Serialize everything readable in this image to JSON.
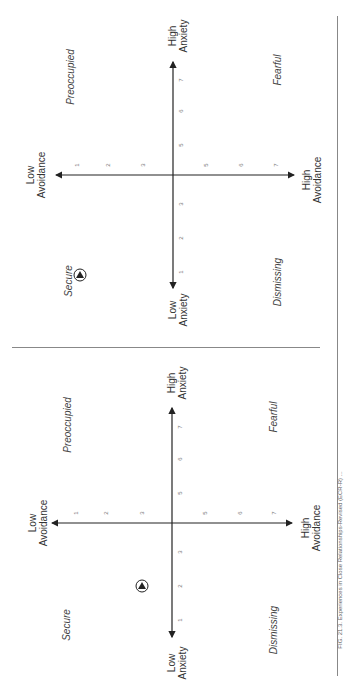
{
  "figure": {
    "caption": "FIG. 21.3. Experiences in Close Relationships-Revised (ECR-R) ..."
  },
  "panels": [
    {
      "id": "top",
      "axes": {
        "avoidance_low": "Low\nAvoidance",
        "avoidance_high": "High\nAvoidance",
        "anxiety_low": "Low\nAnxiety",
        "anxiety_high": "High\nAnxiety"
      },
      "quadrants": {
        "preoccupied": "Preoccupied",
        "fearful": "Fearful",
        "dismissing": "Dismissing",
        "secure": "Secure"
      },
      "avoidance_ticks": [
        "1",
        "2",
        "3",
        "5",
        "6",
        "7"
      ],
      "anxiety_ticks": [
        "1",
        "2",
        "3",
        "5",
        "6",
        "7"
      ],
      "marker": {
        "label": "Secure",
        "avoidance": 1.3,
        "anxiety": 1.0
      }
    },
    {
      "id": "bottom",
      "axes": {
        "avoidance_low": "Low\nAvoidance",
        "avoidance_high": "High\nAvoidance",
        "anxiety_low": "Low\nAnxiety",
        "anxiety_high": "High\nAnxiety"
      },
      "quadrants": {
        "preoccupied": "Preoccupied",
        "fearful": "Fearful",
        "dismissing": "Dismissing",
        "secure": "Secure"
      },
      "avoidance_ticks": [
        "1",
        "2",
        "3",
        "5",
        "6",
        "7"
      ],
      "anxiety_ticks": [
        "1",
        "2",
        "3",
        "5",
        "6",
        "7"
      ],
      "marker": {
        "avoidance": 3.0,
        "anxiety": 2.0
      }
    }
  ],
  "colors": {
    "axis": "#222222",
    "text": "#333333",
    "rule": "#888888"
  }
}
